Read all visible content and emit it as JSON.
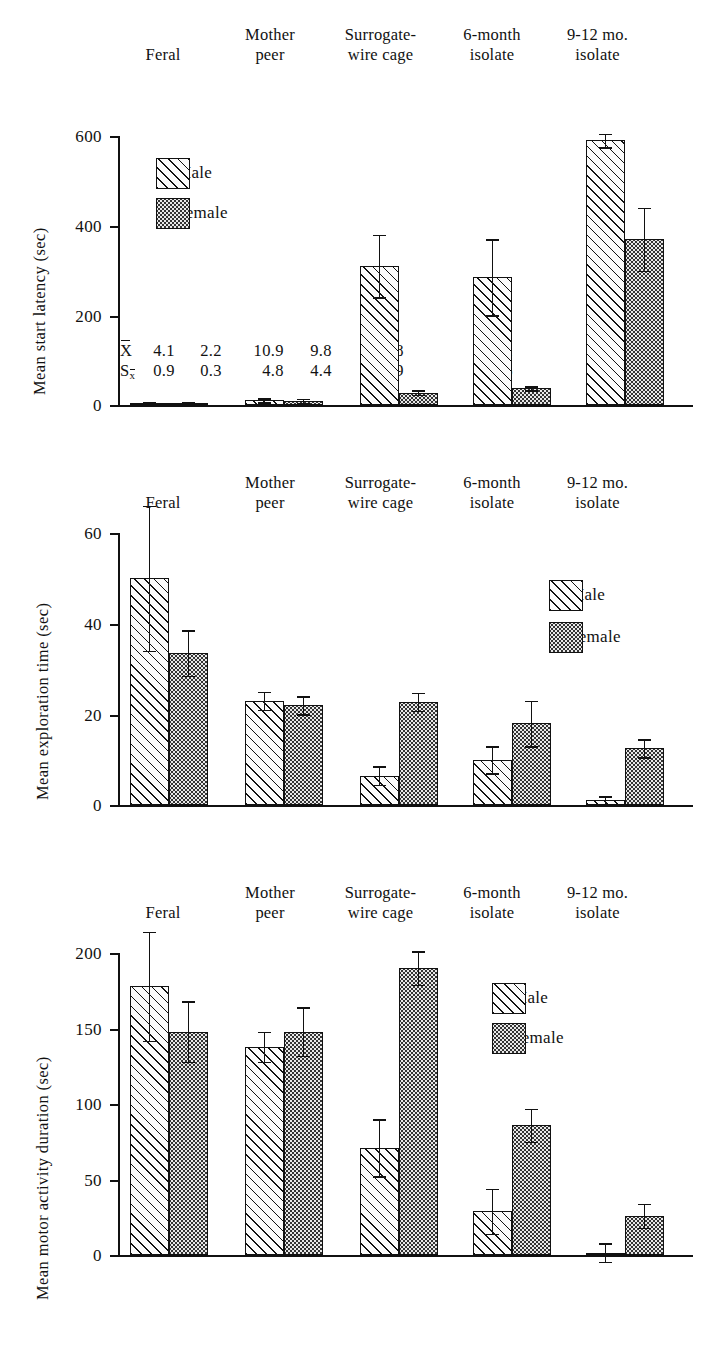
{
  "figure": {
    "groups": [
      "Feral",
      "Mother\npeer",
      "Surrogate-\nwire cage",
      "6-month\nisolate",
      "9-12 mo.\nisolate"
    ],
    "legend": {
      "male": "Male",
      "female": "Female"
    },
    "stat_symbols": {
      "mean": "X",
      "sem": "S",
      "sem_sub": "x"
    }
  },
  "chart_data": [
    {
      "type": "bar",
      "title": "",
      "ylabel": "Mean start latency (sec)",
      "xlabel": "",
      "categories": [
        "Feral",
        "Mother peer",
        "Surrogate-wire cage",
        "6-month isolate",
        "9-12 mo. isolate"
      ],
      "ylim": [
        0,
        600
      ],
      "yticks": [
        0,
        200,
        400,
        600
      ],
      "ytick_labels": [
        "0",
        "200",
        "400",
        "600"
      ],
      "grid": false,
      "legend_position": "upper-left",
      "series": [
        {
          "name": "Male",
          "values": [
            4.1,
            10.9,
            310,
            285,
            590
          ],
          "errors": [
            0.9,
            4.8,
            70,
            85,
            15
          ]
        },
        {
          "name": "Female",
          "values": [
            2.2,
            9.8,
            27.8,
            37.2,
            370
          ],
          "errors": [
            0.3,
            4.4,
            4.9,
            4.5,
            70
          ]
        }
      ],
      "annotations": [
        {
          "group": "Feral",
          "mean_male": "4.1",
          "mean_female": "2.2",
          "sem_male": "0.9",
          "sem_female": "0.3"
        },
        {
          "group": "Mother peer",
          "mean_male": "10.9",
          "mean_female": "9.8",
          "sem_male": "4.8",
          "sem_female": "4.4"
        },
        {
          "group": "Surrogate-wire cage",
          "mean_female": "27.8",
          "sem_female": "4.9"
        },
        {
          "group": "6-month isolate",
          "mean_female": "37.2",
          "sem_female": "4.5"
        }
      ]
    },
    {
      "type": "bar",
      "title": "",
      "ylabel": "Mean exploration time (sec)",
      "xlabel": "",
      "categories": [
        "Feral",
        "Mother peer",
        "Surrogate-wire cage",
        "6-month isolate",
        "9-12 mo. isolate"
      ],
      "ylim": [
        0,
        60
      ],
      "yticks": [
        0,
        20,
        40,
        60
      ],
      "ytick_labels": [
        "0",
        "20",
        "40",
        "60"
      ],
      "grid": false,
      "legend_position": "upper-right",
      "series": [
        {
          "name": "Male",
          "values": [
            50,
            23,
            6.5,
            10,
            1
          ],
          "errors": [
            16,
            2,
            2,
            3,
            1
          ]
        },
        {
          "name": "Female",
          "values": [
            33.5,
            22,
            22.8,
            18,
            12.5
          ],
          "errors": [
            5,
            2,
            2,
            5,
            2
          ]
        }
      ]
    },
    {
      "type": "bar",
      "title": "",
      "ylabel": "Mean motor activity duration (sec)",
      "xlabel": "",
      "categories": [
        "Feral",
        "Mother peer",
        "Surrogate-wire cage",
        "6-month isolate",
        "9-12 mo. isolate"
      ],
      "ylim": [
        0,
        200
      ],
      "yticks": [
        0,
        50,
        100,
        150,
        200
      ],
      "ytick_labels": [
        "0",
        "50",
        "100",
        "150",
        "200"
      ],
      "grid": false,
      "legend_position": "upper-right",
      "series": [
        {
          "name": "Male",
          "values": [
            178,
            138,
            71,
            29,
            1
          ],
          "errors": [
            36,
            10,
            19,
            15,
            6
          ]
        },
        {
          "name": "Female",
          "values": [
            148,
            148,
            190,
            86,
            26
          ],
          "errors": [
            20,
            16,
            11,
            11,
            8
          ]
        }
      ]
    }
  ]
}
